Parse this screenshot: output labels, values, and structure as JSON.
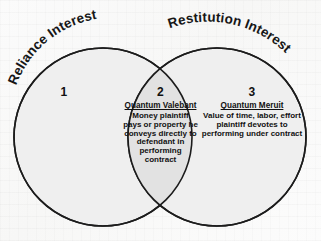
{
  "diagram": {
    "type": "venn",
    "title_labels": {
      "left_circle": "Reliance Interest",
      "right_circle": "Restitution Interest"
    },
    "colors": {
      "circle_fill": "#efefef",
      "overlap_fill": "#e2e2e2",
      "stroke": "#1c1c1c",
      "text": "#111111",
      "background": "#fdfdfd"
    },
    "regions": [
      {
        "number": "1",
        "heading": "",
        "lines": []
      },
      {
        "number": "2",
        "heading": "Quantum Valebant",
        "lines": [
          "Money plaintiff",
          "pays or property he",
          "conveys directly to",
          "defendant in",
          "performing",
          "contract"
        ]
      },
      {
        "number": "3",
        "heading": "Quantum Meruit",
        "lines": [
          "Value of time, labor, effort",
          "plaintiff devotes to",
          "performing under contract"
        ]
      }
    ]
  }
}
